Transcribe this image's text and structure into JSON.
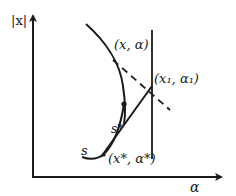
{
  "diagram": {
    "type": "phase-plane-sketch",
    "axes": {
      "y_label": "|x|",
      "x_label": "α"
    },
    "labels": {
      "point_x_alpha": "(x, α)",
      "point_x1_alpha1": "(x₁, α₁)",
      "point_star": "(x*, α*)",
      "s_star": "s*",
      "s": "s"
    },
    "elements": [
      {
        "id": "solution-curve",
        "kind": "curve",
        "style": "solid"
      },
      {
        "id": "tangent-branch",
        "kind": "line",
        "style": "solid"
      },
      {
        "id": "secant-line",
        "kind": "line",
        "style": "dashed"
      },
      {
        "id": "vertical-line",
        "kind": "line",
        "style": "solid"
      },
      {
        "id": "s-star-point",
        "kind": "dot"
      }
    ],
    "colors": {
      "ink": "#1a1a1a",
      "background": "#ffffff"
    }
  }
}
